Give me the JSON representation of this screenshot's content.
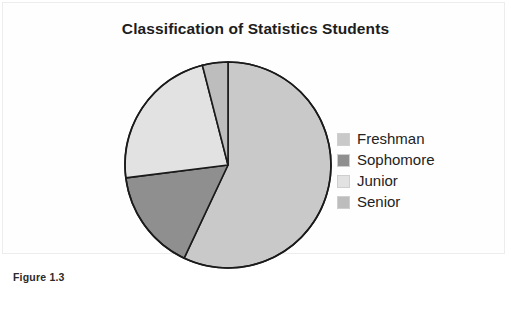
{
  "figure": {
    "caption": "Figure 1.3"
  },
  "chart_data": {
    "type": "pie",
    "title": "Classification of Statistics Students",
    "xlabel": "",
    "ylabel": "",
    "legend_position": "right",
    "grid": false,
    "start_angle_deg": 0,
    "direction": "clockwise",
    "categories": [
      "Freshman",
      "Sophomore",
      "Junior",
      "Senior"
    ],
    "values": [
      57,
      16,
      23,
      4
    ],
    "units": "percent",
    "slice_angles_deg": [
      205.2,
      57.6,
      82.8,
      14.4
    ],
    "colors": [
      "#c9c9c9",
      "#8f8f8f",
      "#e2e2e2",
      "#bdbdbd"
    ],
    "slices": [
      {
        "label": "Freshman",
        "value": 57,
        "color": "#c9c9c9",
        "start_deg": 0.0,
        "end_deg": 205.2
      },
      {
        "label": "Sophomore",
        "value": 16,
        "color": "#8f8f8f",
        "start_deg": 205.2,
        "end_deg": 262.8
      },
      {
        "label": "Junior",
        "value": 23,
        "color": "#e2e2e2",
        "start_deg": 262.8,
        "end_deg": 345.6
      },
      {
        "label": "Senior",
        "value": 4,
        "color": "#bdbdbd",
        "start_deg": 345.6,
        "end_deg": 360.0
      }
    ],
    "outline_color": "#1a1a1a",
    "outline_width": 1.6
  },
  "legend": {
    "entries": [
      {
        "label": "Freshman",
        "color": "#c9c9c9"
      },
      {
        "label": "Sophomore",
        "color": "#8f8f8f"
      },
      {
        "label": "Junior",
        "color": "#e2e2e2"
      },
      {
        "label": "Senior",
        "color": "#bdbdbd"
      }
    ]
  }
}
